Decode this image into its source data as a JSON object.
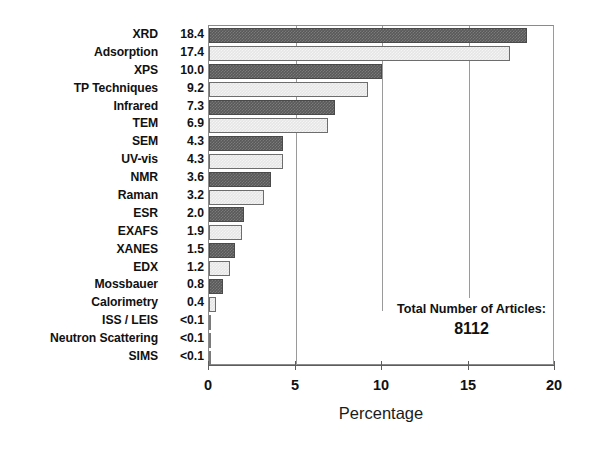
{
  "chart_data": {
    "type": "bar",
    "orientation": "horizontal",
    "title": "",
    "xlabel": "Percentage",
    "ylabel": "",
    "xlim": [
      0,
      20
    ],
    "xticks": [
      0,
      5,
      10,
      15,
      20
    ],
    "xtick_labels": [
      "0",
      "5",
      "10",
      "15",
      "20"
    ],
    "grid": true,
    "grid_axis": "x",
    "legend": false,
    "categories": [
      "XRD",
      "Adsorption",
      "XPS",
      "TP Techniques",
      "Infrared",
      "TEM",
      "SEM",
      "UV-vis",
      "NMR",
      "Raman",
      "ESR",
      "EXAFS",
      "XANES",
      "EDX",
      "Mossbauer",
      "Calorimetry",
      "ISS / LEIS",
      "Neutron Scattering",
      "SIMS"
    ],
    "values": [
      18.4,
      17.4,
      10.0,
      9.2,
      7.3,
      6.9,
      4.3,
      4.3,
      3.6,
      3.2,
      2.0,
      1.9,
      1.5,
      1.2,
      0.8,
      0.4,
      0.05,
      0.05,
      0.05
    ],
    "value_labels": [
      "18.4",
      "17.4",
      "10.0",
      "9.2",
      "7.3",
      "6.9",
      "4.3",
      "4.3",
      "3.6",
      "3.2",
      "2.0",
      "1.9",
      "1.5",
      "1.2",
      "0.8",
      "0.4",
      "<0.1",
      "<0.1",
      "<0.1"
    ],
    "bar_shading": [
      "dark",
      "light",
      "dark",
      "light",
      "dark",
      "light",
      "dark",
      "light",
      "dark",
      "light",
      "dark",
      "light",
      "dark",
      "light",
      "dark",
      "light",
      "dark",
      "light",
      "dark"
    ],
    "annotation": {
      "title": "Total Number of Articles:",
      "value": "8112"
    },
    "colors": {
      "bar_dark": "#595959",
      "bar_light": "#e6e6e6",
      "bar_edge": "#4a4a4a",
      "axis": "#5d5d5d",
      "grid": "#9a9a9a",
      "text": "#111111",
      "background": "#ffffff"
    }
  }
}
